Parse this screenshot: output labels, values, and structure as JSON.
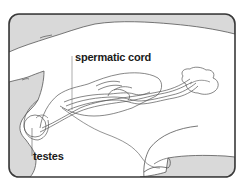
{
  "diagram": {
    "labels": [
      {
        "id": "spermatic-cord",
        "text": "spermatic cord"
      },
      {
        "id": "testes",
        "text": "testes"
      }
    ],
    "colors": {
      "frame_stroke": "#3a3a3a",
      "body_fill": "#d9d9d9",
      "background": "#ffffff",
      "line": "#555555",
      "label_text": "#1a1a1a"
    }
  }
}
